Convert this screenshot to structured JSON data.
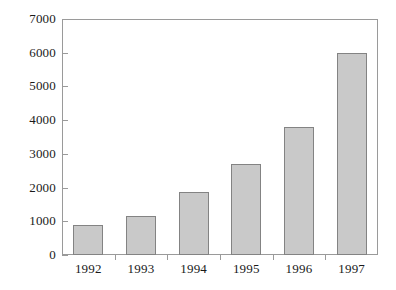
{
  "chart_data": {
    "type": "bar",
    "title": "",
    "subtitle": "",
    "xlabel": "",
    "ylabel": "",
    "categories": [
      "1992",
      "1993",
      "1994",
      "1995",
      "1996",
      "1997"
    ],
    "values": [
      900,
      1150,
      1870,
      2700,
      3800,
      6000
    ],
    "series": [
      {
        "name": "",
        "values": [
          900,
          1150,
          1870,
          2700,
          3800,
          6000
        ]
      }
    ],
    "ylim": [
      0,
      7000
    ],
    "y_ticks": [
      0,
      1000,
      2000,
      3000,
      4000,
      5000,
      6000,
      7000
    ],
    "y_tick_labels": [
      "0",
      "1000",
      "2000",
      "3000",
      "4000",
      "5000",
      "6000",
      "7000"
    ],
    "x_tick_labels": [
      "1992",
      "1993",
      "1994",
      "1995",
      "1996",
      "1997"
    ],
    "grid": false,
    "legend": false,
    "legend_position": "none",
    "annotations": [],
    "colors": {
      "bar_fill": "#c9c9c9",
      "bar_edge": "#838383",
      "axis": "#9a9a9a",
      "text": "#1a1a1a",
      "background": "#ffffff"
    }
  }
}
